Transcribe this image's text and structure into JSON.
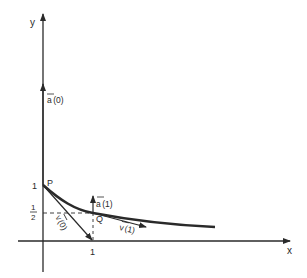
{
  "figure": {
    "axes": {
      "x_label": "x",
      "y_label": "y"
    },
    "ticks": {
      "x_one": "1",
      "y_one": "1",
      "y_half_num": "1",
      "y_half_den": "2"
    },
    "points": {
      "P": "P",
      "Q": "Q"
    },
    "vectors": {
      "a0": {
        "name": "a",
        "arg": "(0)"
      },
      "a1": {
        "name": "a",
        "arg": "(1)"
      },
      "v0": {
        "name": "v",
        "arg": "(0)"
      },
      "v1": {
        "name": "v",
        "arg": "(1)"
      }
    },
    "colors": {
      "ink": "#2a2a2a",
      "background": "#ffffff"
    }
  }
}
